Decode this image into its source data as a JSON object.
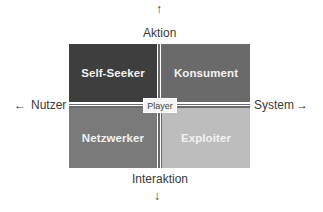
{
  "diagram": {
    "axes": {
      "top": {
        "label": "Aktion",
        "arrow": "↑"
      },
      "bottom": {
        "label": "Interaktion",
        "arrow": "↓"
      },
      "left": {
        "label": "Nutzer",
        "arrow": "←"
      },
      "right": {
        "label": "System",
        "arrow": "→"
      }
    },
    "center_label": "Player",
    "quadrants": [
      {
        "position": "top-left",
        "label": "Self-Seeker",
        "color": "#3e3e3e"
      },
      {
        "position": "top-right",
        "label": "Konsument",
        "color": "#6a6a6a"
      },
      {
        "position": "bottom-left",
        "label": "Netzwerker",
        "color": "#7a7a7a"
      },
      {
        "position": "bottom-right",
        "label": "Exploiter",
        "color": "#bdbdbd"
      }
    ]
  }
}
